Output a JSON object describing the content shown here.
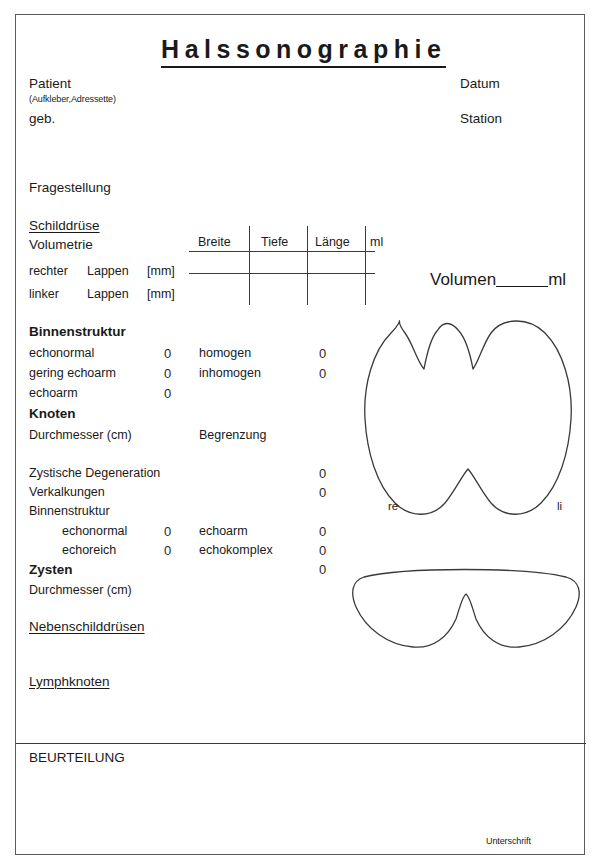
{
  "document": {
    "title": "Halssonographie"
  },
  "header": {
    "patient_label": "Patient",
    "patient_sub": "(Aufkleber,Adressette)",
    "geb_label": "geb.",
    "datum_label": "Datum",
    "station_label": "Station"
  },
  "fragestellung": {
    "label": "Fragestellung"
  },
  "schilddruese": {
    "heading": "Schilddrüse",
    "volumetrie_label": "Volumetrie",
    "table": {
      "columns": [
        "Breite",
        "Tiefe",
        "Länge",
        "ml"
      ],
      "rows": [
        {
          "side": "rechter",
          "lobe": "Lappen",
          "unit": "[mm]"
        },
        {
          "side": "linker",
          "lobe": "Lappen",
          "unit": "[mm]"
        }
      ]
    },
    "volumen_field": {
      "label": "Volumen",
      "value": "",
      "unit": "ml"
    },
    "binnenstruktur": {
      "heading": "Binnenstruktur",
      "left_options": [
        {
          "label": "echonormal",
          "checkbox": "0"
        },
        {
          "label": "gering echoarm",
          "checkbox": "0"
        },
        {
          "label": "echoarm",
          "checkbox": "0"
        }
      ],
      "right_options": [
        {
          "label": "homogen",
          "checkbox": "0"
        },
        {
          "label": "inhomogen",
          "checkbox": "0"
        }
      ]
    },
    "knoten": {
      "heading": "Knoten",
      "durchmesser_label": "Durchmesser (cm)",
      "begrenzung_label": "Begrenzung",
      "findings": [
        {
          "label": "Zystische Degeneration",
          "checkbox": "0"
        },
        {
          "label": "Verkalkungen",
          "checkbox": "0"
        }
      ],
      "binnenstruktur_heading": "Binnenstruktur",
      "binnenstruktur_left": [
        {
          "label": "echonormal",
          "checkbox": "0"
        },
        {
          "label": "echoreich",
          "checkbox": "0"
        }
      ],
      "binnenstruktur_right": [
        {
          "label": "echoarm",
          "checkbox": "0"
        },
        {
          "label": "echokomplex",
          "checkbox": "0"
        }
      ]
    },
    "zysten": {
      "heading": "Zysten",
      "checkbox": "0",
      "durchmesser_label": "Durchmesser (cm)"
    }
  },
  "diagrams": {
    "frontal": {
      "label_right": "re",
      "label_left": "li"
    },
    "transverse": {}
  },
  "nebenschilddruesen": {
    "heading": "Nebenschilddrüsen"
  },
  "lymphknoten": {
    "heading": "Lymphknoten"
  },
  "beurteilung": {
    "heading": "BEURTEILUNG",
    "signature_label": "Unterschrift"
  }
}
